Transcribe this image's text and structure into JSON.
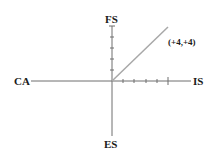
{
  "diagram": {
    "type": "coordinate-axes",
    "axes": {
      "top_label": "FS",
      "bottom_label": "ES",
      "left_label": "CA",
      "right_label": "IS"
    },
    "point": {
      "label": "(+4,+4)",
      "x": 4,
      "y": 4
    },
    "ticks": {
      "positive_x_count": 5,
      "positive_y_count": 5
    },
    "colors": {
      "axis": "#6e6e6e",
      "vector": "#a8a8a8",
      "text": "#1a1a1a"
    }
  }
}
